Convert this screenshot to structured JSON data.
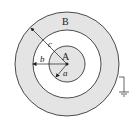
{
  "diagram": {
    "labels": {
      "outer_shell": "B",
      "inner_sphere": "A",
      "radius_a": "a",
      "radius_b": "b",
      "radius_c": "c"
    },
    "colors": {
      "shaded": "#e4e4e4",
      "stroke": "#222222",
      "background": "#ffffff"
    }
  }
}
